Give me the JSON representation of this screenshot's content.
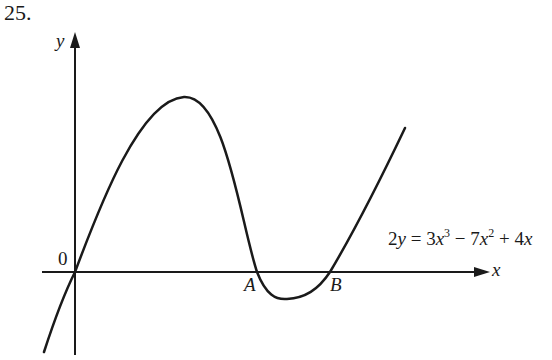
{
  "question_number": "25.",
  "axes": {
    "x_label": "x",
    "y_label": "y",
    "origin_label": "0"
  },
  "points": {
    "A": "A",
    "B": "B"
  },
  "equation": {
    "lhs_coef": "2",
    "lhs_var": "y",
    "eq": " = ",
    "t1_coef": "3",
    "t1_var": "x",
    "t1_exp": "3",
    "op1": " − ",
    "t2_coef": "7",
    "t2_var": "x",
    "t2_exp": "2",
    "op2": " + ",
    "t3_coef": "4",
    "t3_var": "x"
  },
  "colors": {
    "ink": "#1a1a1a",
    "background": "#ffffff"
  }
}
